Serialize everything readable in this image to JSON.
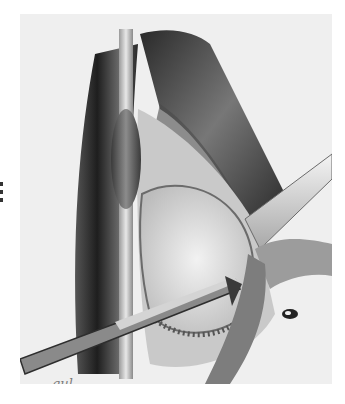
{
  "illustration": {
    "description": "Grayscale surgical illustration: vessel opened with retractors, balloon catheter in vein, forceps entering from lower left",
    "palette": {
      "paper": "#ffffff",
      "background_wash": "#efefef",
      "dark_tissue": "#2e2e2e",
      "mid_tissue": "#8a8a8a",
      "light_tissue": "#d8d8d8"
    },
    "signature": "gul"
  }
}
